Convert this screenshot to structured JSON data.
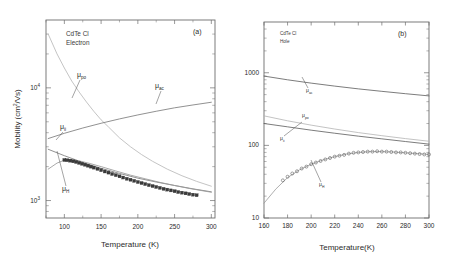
{
  "figure": {
    "background": "#ffffff",
    "panels": [
      "a",
      "b"
    ]
  },
  "panel_a": {
    "label": "(a)",
    "annotation_line1": "CdTe Cl",
    "annotation_line2": "Electron",
    "xlabel": "Temperature (K)",
    "ylabel_main": "Mobility (cm",
    "ylabel_sup": "2",
    "ylabel_tail": "/Vs)",
    "xticks": [
      100,
      150,
      200,
      250,
      300
    ],
    "xticklabels": [
      "100",
      "150",
      "200",
      "250",
      "300"
    ],
    "yticklabels": [
      "10",
      "10"
    ],
    "yticksups": [
      "4",
      "3"
    ],
    "curve_labels": {
      "po": "μ",
      "po_sub": "po",
      "ac": "μ",
      "ac_sub": "ac",
      "ii": "μ",
      "ii_sub": "ii",
      "h": "μ",
      "h_sub": "H"
    }
  },
  "panel_b": {
    "label": "(b)",
    "annotation_line1": "CdTe Cl",
    "annotation_line2": "Hole",
    "xlabel": "Temperature(K)",
    "xticks": [
      160,
      180,
      200,
      220,
      240,
      260,
      280,
      300
    ],
    "xticklabels": [
      "160",
      "180",
      "200",
      "220",
      "240",
      "260",
      "280",
      "300"
    ],
    "yticklabels": [
      "10",
      "100",
      "1000"
    ],
    "curve_labels": {
      "ac": "μ",
      "ac_sub": "ac",
      "po": "μ",
      "po_sub": "po",
      "ii": "μ",
      "ii_sub": "ii",
      "h": "μ",
      "h_sub": "H"
    }
  },
  "chart_data": [
    {
      "type": "line",
      "title": "(a) CdTe Cl Electron mobility vs temperature",
      "xlabel": "Temperature (K)",
      "ylabel": "Mobility (cm2/Vs)",
      "xlim": [
        75,
        305
      ],
      "ylim": [
        700,
        40000
      ],
      "yscale": "log",
      "xscale": "linear",
      "grid": false,
      "legend": "inline-labels",
      "series": [
        {
          "name": "μpo",
          "color": "#b9b9b9",
          "style": "solid",
          "x": [
            78,
            90,
            100,
            110,
            120,
            130,
            140,
            150,
            160,
            175,
            190,
            205,
            220,
            240,
            260,
            280,
            300
          ],
          "y": [
            30000,
            20000,
            15000,
            11500,
            9200,
            7500,
            6200,
            5200,
            4500,
            3600,
            3000,
            2560,
            2230,
            1900,
            1660,
            1480,
            1340
          ]
        },
        {
          "name": "μac",
          "color": "#7d7d7d",
          "style": "solid",
          "x": [
            78,
            100,
            125,
            150,
            175,
            200,
            225,
            250,
            275,
            300
          ],
          "y": [
            3550,
            3950,
            4400,
            4850,
            5300,
            5750,
            6200,
            6650,
            7050,
            7450
          ]
        },
        {
          "name": "μii",
          "color": "#7d7d7d",
          "style": "solid",
          "x": [
            78,
            100,
            125,
            150,
            175,
            200,
            225,
            250,
            275,
            300
          ],
          "y": [
            2850,
            2500,
            2180,
            1930,
            1740,
            1580,
            1460,
            1360,
            1270,
            1195
          ]
        },
        {
          "name": "μH",
          "color": "#9a9a9a",
          "style": "solid",
          "x": [
            78,
            90,
            100,
            110,
            120,
            135,
            150,
            170,
            190,
            210,
            230,
            250,
            270,
            290,
            300
          ],
          "y": [
            1900,
            2150,
            2280,
            2300,
            2250,
            2130,
            2000,
            1830,
            1680,
            1560,
            1450,
            1360,
            1280,
            1215,
            1185
          ]
        }
      ],
      "data_points": {
        "name": "Experimental electron Hall mobility",
        "marker": "filled-square",
        "color": "#3b3b3b",
        "x": [
          100,
          104,
          108,
          112,
          116,
          120,
          124,
          128,
          132,
          136,
          140,
          145,
          150,
          155,
          160,
          165,
          170,
          175,
          180,
          185,
          190,
          195,
          200,
          205,
          210,
          215,
          220,
          225,
          230,
          235,
          240,
          245,
          250,
          255,
          260,
          265,
          270,
          275,
          280
        ],
        "y": [
          2290,
          2280,
          2260,
          2230,
          2200,
          2160,
          2120,
          2080,
          2040,
          2000,
          1960,
          1910,
          1860,
          1810,
          1770,
          1720,
          1680,
          1640,
          1600,
          1560,
          1530,
          1495,
          1460,
          1430,
          1400,
          1370,
          1345,
          1320,
          1295,
          1270,
          1250,
          1230,
          1210,
          1190,
          1175,
          1158,
          1142,
          1128,
          1115
        ]
      }
    },
    {
      "type": "line",
      "title": "(b) CdTe Cl Hole mobility vs temperature",
      "xlabel": "Temperature(K)",
      "ylabel": "Mobility",
      "xlim": [
        160,
        300
      ],
      "ylim": [
        10,
        5000
      ],
      "yscale": "log",
      "xscale": "linear",
      "grid": false,
      "legend": "inline-labels",
      "series": [
        {
          "name": "μac",
          "color": "#5a5a5a",
          "style": "solid",
          "x": [
            160,
            180,
            200,
            220,
            240,
            260,
            280,
            300
          ],
          "y": [
            900,
            800,
            720,
            655,
            600,
            555,
            515,
            480
          ]
        },
        {
          "name": "μpo",
          "color": "#b4b4b4",
          "style": "solid",
          "x": [
            160,
            180,
            200,
            220,
            240,
            260,
            280,
            300
          ],
          "y": [
            255,
            218,
            190,
            168,
            150,
            136,
            124,
            114
          ]
        },
        {
          "name": "μii",
          "color": "#5a5a5a",
          "style": "solid",
          "x": [
            160,
            180,
            200,
            220,
            240,
            260,
            280,
            300
          ],
          "y": [
            200,
            180,
            162,
            147,
            134,
            123,
            113,
            104
          ]
        },
        {
          "name": "μH",
          "color": "#9a9a9a",
          "style": "solid",
          "x": [
            160,
            170,
            180,
            190,
            200,
            210,
            220,
            230,
            240,
            250,
            260,
            270,
            280,
            290,
            300
          ],
          "y": [
            16,
            25,
            36,
            46,
            55,
            63,
            70,
            76,
            80,
            82,
            82,
            81,
            79,
            77,
            75
          ]
        }
      ],
      "data_points": {
        "name": "Experimental hole Hall mobility",
        "marker": "open-circle",
        "color": "#666666",
        "x": [
          176,
          180,
          184,
          188,
          192,
          196,
          200,
          204,
          208,
          212,
          216,
          220,
          224,
          228,
          232,
          236,
          240,
          244,
          248,
          252,
          256,
          260,
          264,
          268,
          272,
          276,
          280,
          284,
          288,
          292,
          296,
          300
        ],
        "y": [
          33,
          37,
          41,
          44,
          48,
          51,
          55,
          58,
          61,
          64,
          67,
          70,
          72,
          74,
          77,
          79,
          80,
          81,
          82,
          82,
          83,
          82,
          82,
          81,
          80,
          80,
          79,
          78,
          77,
          76,
          75,
          75
        ]
      }
    }
  ]
}
